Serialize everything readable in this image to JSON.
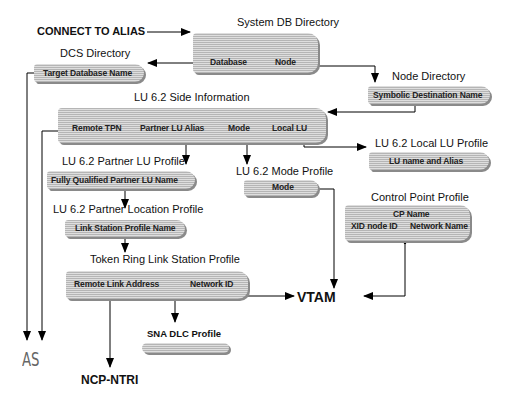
{
  "diagram": {
    "entry_label": "CONNECT TO ALIAS",
    "nodes": {
      "system_db_directory": {
        "title": "System DB Directory",
        "fields": [
          "Database",
          "Node"
        ]
      },
      "dcs_directory": {
        "title": "DCS Directory",
        "fields": [
          "Target Database Name"
        ]
      },
      "node_directory": {
        "title": "Node Directory",
        "fields": [
          "Symbolic Destination Name"
        ]
      },
      "lu62_side_information": {
        "title": "LU 6.2 Side Information",
        "fields": [
          "Remote TPN",
          "Partner LU Alias",
          "Mode",
          "Local LU"
        ]
      },
      "lu62_local_lu_profile": {
        "title": "LU 6.2 Local LU Profile",
        "fields": [
          "LU name and Alias"
        ]
      },
      "lu62_partner_lu_profile": {
        "title": "LU 6.2 Partner LU Profile",
        "fields": [
          "Fully Qualified Partner LU Name"
        ]
      },
      "lu62_mode_profile": {
        "title": "LU 6.2 Mode Profile",
        "fields": [
          "Mode"
        ]
      },
      "control_point_profile": {
        "title": "Control Point Profile",
        "fields": [
          "CP Name",
          "XID node ID",
          "Network Name"
        ]
      },
      "lu62_partner_location_profile": {
        "title": "LU 6.2 Partner Location Profile",
        "fields": [
          "Link Station Profile Name"
        ]
      },
      "token_ring_link_station_profile": {
        "title": "Token Ring Link Station Profile",
        "fields": [
          "Remote Link Address",
          "Network ID"
        ]
      },
      "sna_dlc_profile": {
        "title": "SNA DLC Profile",
        "fields": []
      }
    },
    "endpoints": {
      "vtam": "VTAM",
      "as": "AS",
      "ncp": "NCP-NTRI"
    }
  }
}
